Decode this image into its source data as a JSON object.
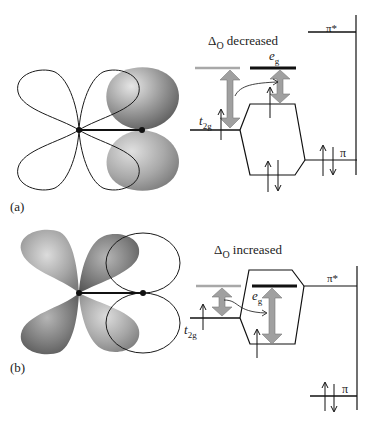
{
  "panel_a": {
    "label": "(a)",
    "title_delta": "Δ",
    "title_sub": "O",
    "title_rest": " decreased",
    "eg_main": "e",
    "eg_sub": "g",
    "t2g_main": "t",
    "t2g_sub": "2g",
    "pi_star": "π*",
    "pi": "π"
  },
  "panel_b": {
    "label": "(b)",
    "title_delta": "Δ",
    "title_sub": "O",
    "title_rest": " increased",
    "eg_main": "e",
    "eg_sub": "g",
    "t2g_main": "t",
    "t2g_sub": "2g",
    "pi_star": "π*",
    "pi": "π"
  },
  "colors": {
    "line": "#1a1a1a",
    "gray_level": "#a8a8a8",
    "arrow_fill": "#a0a0a0",
    "lobe_dark": "#6e6e6e",
    "lobe_light": "#d8d8d8"
  }
}
